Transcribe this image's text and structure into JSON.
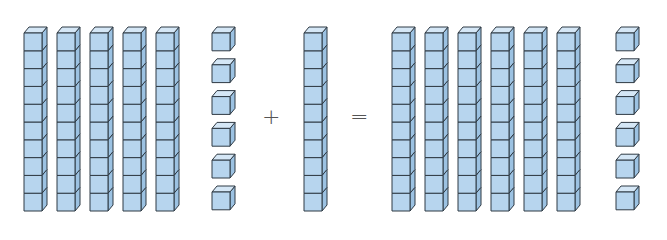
{
  "colors": {
    "front": "#b7d5ee",
    "top": "#d5e7f6",
    "side": "#9cc2e2",
    "stroke": "#2f3a44"
  },
  "geometry": {
    "cube_w": 18,
    "cube_h": 17.8,
    "depth_x": 5,
    "depth_y": 6,
    "rod_top_y": 33,
    "unit_top_y": 33,
    "unit_gap": 31.8
  },
  "operators": {
    "plus": "+",
    "equals": "="
  },
  "groups": [
    {
      "name": "addend-1",
      "value": 56,
      "tens": 5,
      "ones": 6,
      "rod_x": [
        24,
        57,
        90,
        123,
        156
      ],
      "unit_x": 212
    },
    {
      "name": "addend-2",
      "value": 10,
      "tens": 1,
      "ones": 0,
      "rod_x": [
        304
      ],
      "unit_x": null
    },
    {
      "name": "sum",
      "value": 66,
      "tens": 6,
      "ones": 6,
      "rod_x": [
        392,
        425,
        458,
        491,
        524,
        557
      ],
      "unit_x": 616
    }
  ]
}
